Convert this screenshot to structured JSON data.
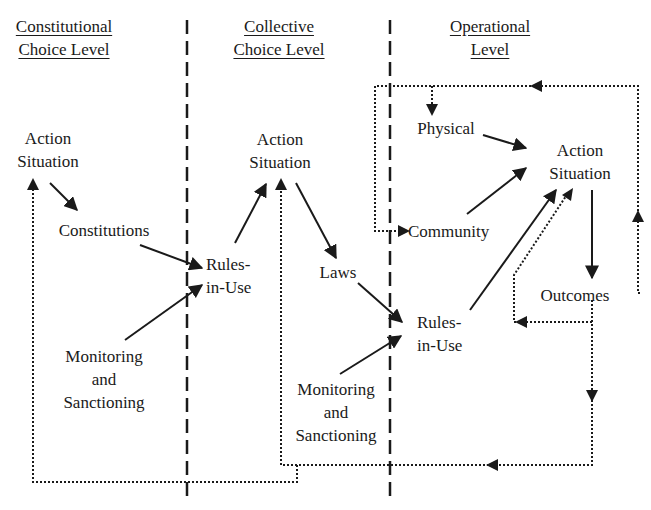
{
  "levels": [
    {
      "title_line1": "Constitutional",
      "title_line2": "Choice Level"
    },
    {
      "title_line1": "Collective",
      "title_line2": "Choice Level"
    },
    {
      "title_line1": "Operational",
      "title_line2": "Level"
    }
  ],
  "constitutional": {
    "action_situation": {
      "line1": "Action",
      "line2": "Situation"
    },
    "constitutions": "Constitutions",
    "monitoring": {
      "line1": "Monitoring",
      "line2": "and",
      "line3": "Sanctioning"
    }
  },
  "collective": {
    "rules_in_use": {
      "line1": "Rules-",
      "line2": "in-Use"
    },
    "action_situation": {
      "line1": "Action",
      "line2": "Situation"
    },
    "laws": "Laws",
    "monitoring": {
      "line1": "Monitoring",
      "line2": "and",
      "line3": "Sanctioning"
    }
  },
  "operational": {
    "rules_in_use": {
      "line1": "Rules-",
      "line2": "in-Use"
    },
    "physical": "Physical",
    "community": "Community",
    "action_situation": {
      "line1": "Action",
      "line2": "Situation"
    },
    "outcomes": "Outcomes"
  },
  "colors": {
    "ink": "#1a1a1a",
    "background": "#ffffff"
  }
}
